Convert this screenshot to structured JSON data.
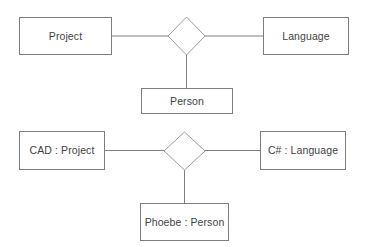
{
  "diagram": {
    "style": {
      "background_color": "#ffffff",
      "box_fill": "#ffffff",
      "box_stroke": "#7d7d7d",
      "diamond_stroke": "#9a9a9a",
      "connector_stroke": "#7d7d7d",
      "text_color": "#3f3f3f"
    },
    "rows": [
      {
        "name": "class-level-row",
        "left_entity": "Project",
        "right_entity": "Language",
        "bottom_entity": "Person",
        "relationship_symbol": "diamond"
      },
      {
        "name": "instance-level-row",
        "left_entity": "CAD : Project",
        "right_entity": "C# : Language",
        "bottom_entity": "Phoebe : Person",
        "relationship_symbol": "diamond"
      }
    ]
  }
}
